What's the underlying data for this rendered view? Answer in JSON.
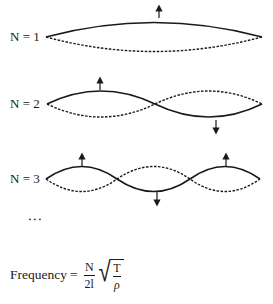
{
  "diagram": {
    "modes": [
      {
        "label": "N = 1",
        "n": 1,
        "nodes_x": [
          46,
          262
        ],
        "baseline_y": 37,
        "arrows": [
          {
            "dir": "up",
            "x": 159
          }
        ]
      },
      {
        "label": "N = 2",
        "n": 2,
        "nodes_x": [
          47,
          155,
          262
        ],
        "baseline_y": 104,
        "arrows": [
          {
            "dir": "up",
            "x": 100
          },
          {
            "dir": "down",
            "x": 216
          }
        ]
      },
      {
        "label": "N = 3",
        "n": 3,
        "nodes_x": [
          46,
          117,
          190,
          260
        ],
        "baseline_y": 179,
        "arrows": [
          {
            "dir": "up",
            "x": 82
          },
          {
            "dir": "down",
            "x": 157
          },
          {
            "dir": "up",
            "x": 226
          }
        ]
      }
    ],
    "continuation": "⋮",
    "formula": {
      "lhs": "Frequency",
      "equals": "=",
      "numerator": "N",
      "denominator": "2l",
      "radical_numerator": "T",
      "radical_denominator": "ρ"
    },
    "colors": {
      "ink": "#1a1a1a",
      "background": "#ffffff"
    },
    "legend": {
      "solid": "string displacement (one extreme)",
      "dashed": "string displacement (opposite extreme)"
    }
  }
}
